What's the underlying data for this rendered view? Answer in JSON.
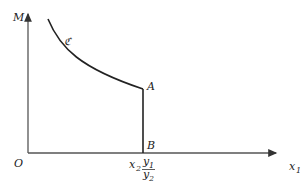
{
  "diagram": {
    "axes": {
      "y_label": "M",
      "x_label": "x",
      "x_label_sub": "1",
      "origin_label": "O"
    },
    "curve": {
      "label": "ℭ"
    },
    "points": {
      "A": "A",
      "B": "B"
    },
    "annotations": {
      "x2": "x",
      "x2_sub": "2",
      "y1": "y",
      "y1_sub": "1",
      "y2": "y",
      "y2_sub": "2"
    },
    "colors": {
      "axis": "#555555",
      "curve": "#222222"
    }
  }
}
